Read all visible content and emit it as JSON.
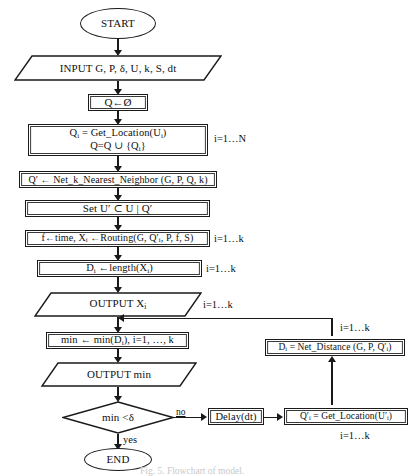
{
  "figure": {
    "caption": "Fig. 5. Flowchart of model.",
    "ink_color": "#1a1a1a",
    "background": "#ffffff"
  },
  "nodes": {
    "start": {
      "label": "START",
      "shape": "ellipse"
    },
    "input": {
      "label": "INPUT G, P, δ, U, k, S, dt",
      "shape": "parallelogram"
    },
    "init_q": {
      "label": "Q←Ø",
      "shape": "rect"
    },
    "get_location": {
      "line1_a": "Q",
      "line1_sub": "i",
      "line1_b": " = Get_Location(U",
      "line1_sub2": "i",
      "line1_c": ")",
      "line2_a": "Q=Q ∪ {Q",
      "line2_sub": "i",
      "line2_b": "}",
      "shape": "rect"
    },
    "knn": {
      "label": "Q′ ← Net_k_Nearest_Neighbor (G, P, Q, k)",
      "shape": "rect"
    },
    "set_u": {
      "label": "Set U′ ⊂ U | Q′",
      "shape": "rect"
    },
    "routing": {
      "a": "f←time, X",
      "sub1": "i",
      "b": " ←Routing(G, Q′",
      "sub2": "i",
      "c": ", P, f, S)",
      "shape": "rect"
    },
    "length": {
      "a": "D",
      "sub1": "i",
      "b": " ←length(X",
      "sub2": "i",
      "c": ")",
      "shape": "rect"
    },
    "output_x": {
      "a": "OUTPUT X",
      "sub1": "i",
      "shape": "parallelogram"
    },
    "min_calc": {
      "a": "min ← min(D",
      "sub1": "i",
      "b": "), i=1, …, k",
      "shape": "rect"
    },
    "output_min": {
      "label": "OUTPUT min",
      "shape": "parallelogram"
    },
    "decision": {
      "label": "min <δ",
      "shape": "diamond"
    },
    "end": {
      "label": "END",
      "shape": "ellipse"
    },
    "delay": {
      "label": "Delay(dt)",
      "shape": "rect"
    },
    "get_location2": {
      "a": "Q′",
      "sub1": "i",
      "b": " = Get_Location(U′",
      "sub2": "i",
      "c": ")",
      "shape": "rect"
    },
    "net_distance": {
      "a": "D",
      "sub1": "i",
      "b": " = Net_Distance (G, P, Q′",
      "sub2": "i",
      "c": ")",
      "shape": "rect"
    }
  },
  "annotations": {
    "i_1_N": "i=1…N",
    "i_1_k_routing": "i=1…k",
    "i_1_k_length": "i=1…k",
    "i_1_k_output": "i=1…k",
    "i_1_k_netdist": "i=1…k",
    "i_1_k_getloc2": "i=1…k",
    "branch_no": "no",
    "branch_yes": "yes"
  }
}
